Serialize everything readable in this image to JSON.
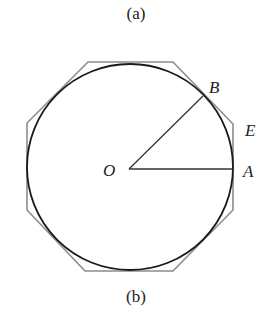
{
  "captions": {
    "top": "(a)",
    "bottom": "(b)"
  },
  "figure": {
    "circle": {
      "cx": 130,
      "cy": 167,
      "r": 103,
      "stroke": "#1a1a1a"
    },
    "octagon": {
      "points": "88,62 173,62 233,124 233,210 173,271 85,271 27,210 27,123",
      "stroke": "#8c8c8c"
    },
    "segments": [
      {
        "name": "OA",
        "x1": 129,
        "y1": 169,
        "x2": 233,
        "y2": 169
      },
      {
        "name": "OB",
        "x1": 129,
        "y1": 169,
        "x2": 203,
        "y2": 96
      }
    ],
    "labels": {
      "O": {
        "text": "O",
        "x": 103,
        "y": 176
      },
      "A": {
        "text": "A",
        "x": 243,
        "y": 177
      },
      "B": {
        "text": "B",
        "x": 209,
        "y": 93
      },
      "E": {
        "text": "E",
        "x": 245,
        "y": 136
      }
    }
  }
}
